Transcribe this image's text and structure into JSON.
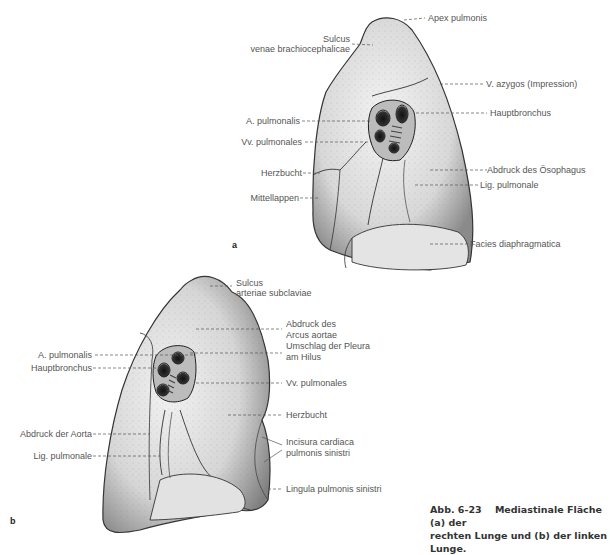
{
  "figure": {
    "caption": {
      "number": "Abb. 6-23",
      "line1": "Mediastinale Fläche (a) der",
      "line2": "rechten Lunge und (b) der linken Lunge."
    },
    "panel_a": {
      "letter": "a",
      "title": "Rechte Lunge, mediastinale Fläche",
      "labels": {
        "apex": "Apex pulmonis",
        "sulcus_l1": "Sulcus",
        "sulcus_l2": "venae brachiocephalicae",
        "azygos": "V. azygos (Impression)",
        "a_pulm": "A. pulmonalis",
        "hauptbronchus": "Hauptbronchus",
        "vv_pulm": "Vv. pulmonales",
        "herzbucht": "Herzbucht",
        "oesophagus": "Abdruck des Ösophagus",
        "lig_pulm": "Lig. pulmonale",
        "mittellappen": "Mittellappen",
        "facies": "Facies diaphragmatica"
      }
    },
    "panel_b": {
      "letter": "b",
      "title": "Linke Lunge, mediastinale Fläche",
      "labels": {
        "sulcus_l1": "Sulcus",
        "sulcus_l2": "arteriae subclaviae",
        "arcus_l1": "Abdruck des",
        "arcus_l2": "Arcus aortae",
        "umschlag_l1": "Umschlag der Pleura",
        "umschlag_l2": "am Hilus",
        "a_pulm": "A. pulmonalis",
        "hauptbronchus": "Hauptbronchus",
        "vv_pulm": "Vv. pulmonales",
        "herzbucht": "Herzbucht",
        "aorta": "Abdruck der Aorta",
        "incisura_l1": "Incisura cardiaca",
        "incisura_l2": "pulmonis sinistri",
        "lig_pulm": "Lig. pulmonale",
        "lingula": "Lingula pulmonis sinistri"
      }
    }
  }
}
